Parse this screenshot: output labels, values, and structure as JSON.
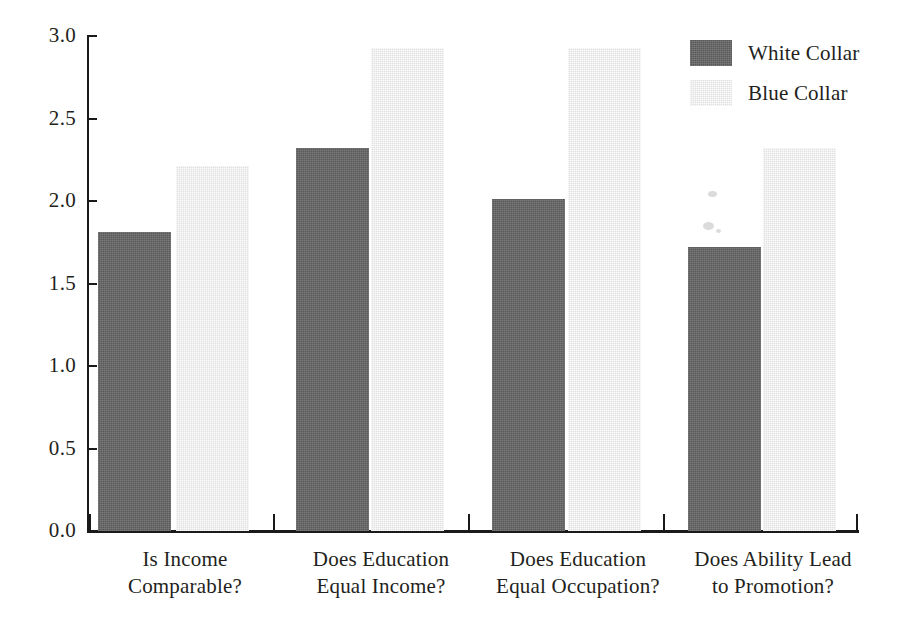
{
  "chart_data": {
    "type": "bar",
    "title": "",
    "subtitle": "",
    "xlabel": "",
    "ylabel": "",
    "ylim": [
      0.0,
      3.0
    ],
    "ytick_labels": [
      "0.0",
      "0.5",
      "1.0",
      "1.5",
      "2.0",
      "2.5",
      "3.0"
    ],
    "ytick_values": [
      0.0,
      0.5,
      1.0,
      1.5,
      2.0,
      2.5,
      3.0
    ],
    "grid": false,
    "legend_position": "top-right",
    "categories": [
      "Is Income Comparable?",
      "Does Education Equal Income?",
      "Does Education Equal Occupation?",
      "Does Ability Lead to Promotion?"
    ],
    "category_lines": [
      [
        "Is Income",
        "Comparable?"
      ],
      [
        "Does Education",
        "Equal Income?"
      ],
      [
        "Does Education",
        "Equal Occupation?"
      ],
      [
        "Does Ability Lead",
        "to Promotion?"
      ]
    ],
    "series": [
      {
        "name": "White Collar",
        "color": "#595959",
        "values": [
          1.81,
          2.32,
          2.01,
          1.72
        ]
      },
      {
        "name": "Blue Collar",
        "color": "#e1e1e1",
        "values": [
          2.21,
          2.93,
          2.93,
          2.32
        ]
      }
    ]
  },
  "legend": {
    "items": [
      {
        "label": "White Collar",
        "swatch": "#595959"
      },
      {
        "label": "Blue Collar",
        "swatch": "#e1e1e1"
      }
    ]
  }
}
